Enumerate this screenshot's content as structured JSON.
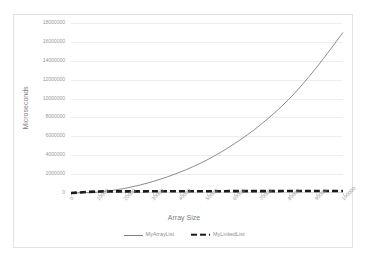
{
  "chart_data": {
    "type": "line",
    "title": "",
    "xlabel": "Array Size",
    "ylabel": "Microseconds",
    "xlim": [
      0,
      100000
    ],
    "ylim": [
      0,
      18000000
    ],
    "grid": true,
    "legend_position": "bottom",
    "x_tick_labels": [
      "0",
      "10000",
      "20000",
      "30000",
      "40000",
      "50000",
      "60000",
      "70000",
      "80000",
      "90000",
      "100000"
    ],
    "y_tick_labels": [
      "0",
      "2000000",
      "4000000",
      "6000000",
      "8000000",
      "10000000",
      "12000000",
      "14000000",
      "16000000",
      "18000000"
    ],
    "y_tick_values": [
      0,
      2000000,
      4000000,
      6000000,
      8000000,
      10000000,
      12000000,
      14000000,
      16000000,
      18000000
    ],
    "x": [
      0,
      10000,
      20000,
      30000,
      40000,
      50000,
      60000,
      70000,
      80000,
      90000,
      100000
    ],
    "series": [
      {
        "name": "MyArrayList",
        "color": "#7f7f7f",
        "style": "solid",
        "values": [
          0,
          100000,
          500000,
          1200000,
          2200000,
          3500000,
          5200000,
          7300000,
          9900000,
          13200000,
          17000000
        ]
      },
      {
        "name": "MyLinkedList",
        "color": "#1a1a1a",
        "style": "dashed",
        "values": [
          0,
          160000,
          170000,
          180000,
          185000,
          190000,
          195000,
          200000,
          205000,
          210000,
          215000
        ]
      }
    ]
  },
  "legend": {
    "items": [
      {
        "label": "MyArrayList"
      },
      {
        "label": "MyLinkedList"
      }
    ]
  },
  "colors": {
    "series_array_list": "#7f7f7f",
    "series_linked_list": "#1a1a1a",
    "gridline": "#ededed",
    "axis": "#d9d9d9",
    "tick_text": "#9c9c9c",
    "title_text": "#808080",
    "border": "#e2e2e2",
    "background": "#ffffff"
  }
}
